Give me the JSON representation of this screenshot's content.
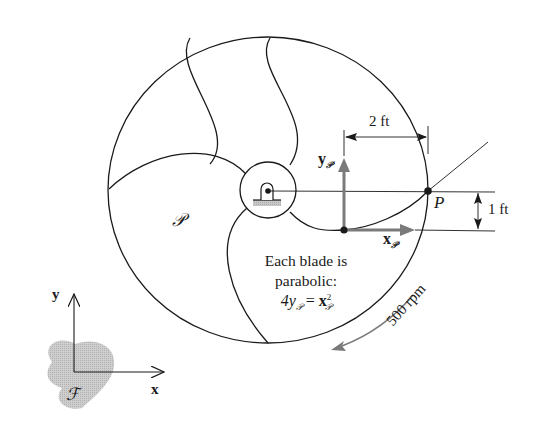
{
  "figure": {
    "type": "engineering-mechanics-diagram",
    "colors": {
      "line": "#1a1a1a",
      "axis_arrow_gray": "#7a7a7a",
      "frame_blob": "#b8b8b8",
      "ground_hatch": "#bdbdbd"
    }
  },
  "labels": {
    "body_frame": "𝒫",
    "ground_frame": "ℱ",
    "point": "P",
    "axis_y_body": "y",
    "axis_x_body": "x",
    "axis_sub": "𝒫",
    "axis_y_ground": "y",
    "axis_x_ground": "x",
    "dim_horizontal": "2 ft",
    "dim_vertical": "1 ft",
    "rotation_speed": "500 rpm"
  },
  "caption": {
    "line1": "Each blade is",
    "line2": "parabolic:",
    "eq_lhs": "4y",
    "eq_eq": " = ",
    "eq_rhs": "x",
    "eq_sup": "2",
    "eq_sub": "𝒫"
  },
  "geometry": {
    "wheel_center": [
      268,
      190
    ],
    "wheel_radius_px": 160,
    "hub_radius_px": 28,
    "blade_count": 3,
    "body_origin": [
      344,
      230
    ],
    "point_P": [
      428,
      191
    ]
  }
}
